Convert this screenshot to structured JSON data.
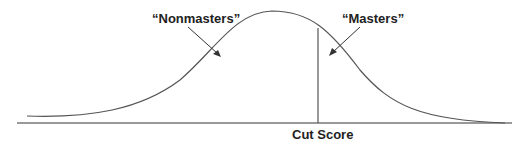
{
  "diagram": {
    "labels": {
      "nonmasters": "“Nonmasters”",
      "masters": "“Masters”",
      "cut_score": "Cut Score"
    },
    "colors": {
      "curve": "#555555",
      "axis": "#777777",
      "text": "#222222"
    }
  }
}
